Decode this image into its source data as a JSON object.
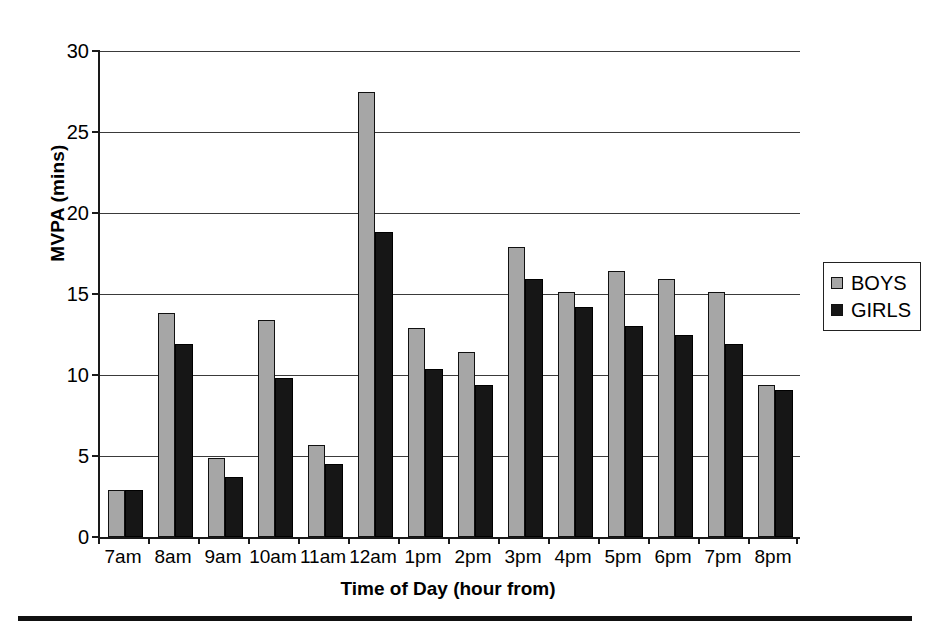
{
  "chart_data": {
    "type": "bar",
    "title": "",
    "xlabel": "Time of Day (hour from)",
    "ylabel": "MVPA (mins)",
    "ylim": [
      0,
      30
    ],
    "ytick_step": 5,
    "yticks": [
      0,
      5,
      10,
      15,
      20,
      25,
      30
    ],
    "ytick_labels": [
      "0",
      "5",
      "10",
      "15",
      "20",
      "25",
      "30"
    ],
    "grid": "horizontal",
    "legend_position": "right",
    "categories": [
      "7am",
      "8am",
      "9am",
      "10am",
      "11am",
      "12am",
      "1pm",
      "2pm",
      "3pm",
      "4pm",
      "5pm",
      "6pm",
      "7pm",
      "8pm"
    ],
    "series": [
      {
        "name": "BOYS",
        "color": "#a6a6a6",
        "values": [
          2.9,
          13.8,
          4.9,
          13.4,
          5.7,
          27.5,
          12.9,
          11.4,
          17.9,
          15.1,
          16.4,
          15.9,
          15.1,
          9.4
        ]
      },
      {
        "name": "GIRLS",
        "color": "#161616",
        "values": [
          2.9,
          11.9,
          3.7,
          9.8,
          4.5,
          18.8,
          10.4,
          9.4,
          15.9,
          14.2,
          13.0,
          12.5,
          11.9,
          9.1
        ]
      }
    ]
  },
  "legend": {
    "entries": [
      {
        "label": "BOYS",
        "swatch": "gray-square"
      },
      {
        "label": "GIRLS",
        "swatch": "black-square"
      }
    ]
  },
  "colors": {
    "boys": "#a6a6a6",
    "girls": "#161616",
    "axis": "#1a1a1a",
    "grid": "#3a3a3a",
    "background": "#ffffff"
  }
}
